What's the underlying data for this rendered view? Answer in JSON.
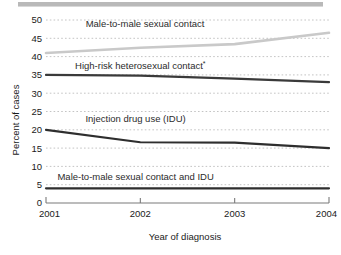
{
  "chart_data": {
    "type": "line",
    "title": "",
    "xlabel": "Year of diagnosis",
    "ylabel": "Percent of cases",
    "x": [
      2001,
      2002,
      2003,
      2004
    ],
    "categories": [
      "2001",
      "2002",
      "2003",
      "2004"
    ],
    "xlim": [
      2001,
      2004
    ],
    "ylim": [
      0,
      50
    ],
    "ytick_labels": [
      "0",
      "5",
      "10",
      "15",
      "20",
      "25",
      "30",
      "35",
      "40",
      "45",
      "50"
    ],
    "ytick_values": [
      0,
      5,
      10,
      15,
      20,
      25,
      30,
      35,
      40,
      45,
      50
    ],
    "xtick_labels": [
      "2001",
      "2002",
      "2003",
      "2004"
    ],
    "grid": "horizontal-dashed",
    "legend": "inline-labels-above-lines",
    "series": [
      {
        "name": "Male-to-male sexual contact",
        "label": "Male-to-male sexual contact",
        "color": "#c9c9c9",
        "values": [
          41.0,
          42.4,
          43.4,
          46.5
        ],
        "label_x": 2002.05,
        "label_y": 48.2,
        "label_anchor": "middle"
      },
      {
        "name": "High-risk heterosexual contact*",
        "label": "High-risk heterosexual contact",
        "superscript": "*",
        "color": "#3a3a3a",
        "values": [
          35.0,
          34.8,
          34.0,
          33.0
        ],
        "label_x": 2002.0,
        "label_y": 36.6,
        "label_anchor": "middle"
      },
      {
        "name": "Injection drug use (IDU)",
        "label": "Injection drug use (IDU)",
        "color": "#2e2e2e",
        "values": [
          20.0,
          16.6,
          16.5,
          15.0
        ],
        "label_x": 2001.95,
        "label_y": 22.0,
        "label_anchor": "middle"
      },
      {
        "name": "Male-to-male sexual contact and IDU",
        "label": "Male-to-male sexual contact and IDU",
        "color": "#2e2e2e",
        "values": [
          4.0,
          4.0,
          4.0,
          4.0
        ],
        "label_x": 2001.95,
        "label_y": 6.4,
        "label_anchor": "middle"
      }
    ]
  },
  "axes": {
    "y_axis_title": "Percent of cases",
    "x_axis_title": "Year of diagnosis"
  },
  "colors": {
    "background": "#ffffff",
    "grid": "#b5b5b5",
    "axis": "#7a7a7a",
    "text": "#1a1a1a",
    "top_rule": "#b9b9b9"
  }
}
